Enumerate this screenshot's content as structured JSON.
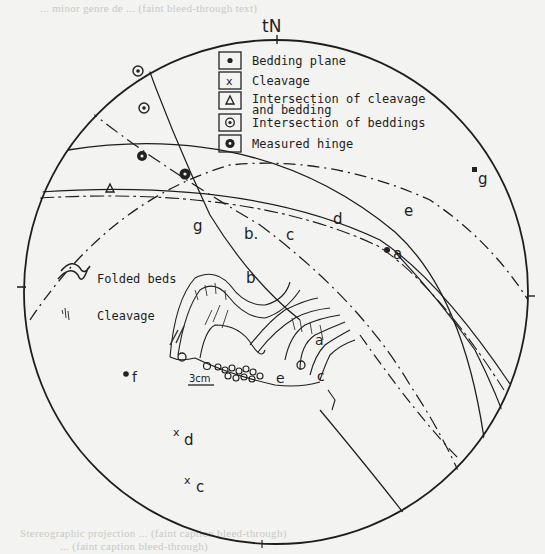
{
  "figure": {
    "north_label": "tN",
    "faint_header_text": "... minor genre de ... (faint bleed-through text)",
    "faint_caption_line1": "Stereographic projection ... (faint caption bleed-through)",
    "faint_caption_line2": "... (faint caption bleed-through)"
  },
  "legend": {
    "items": [
      {
        "symbol": "dot",
        "label": "Bedding plane"
      },
      {
        "symbol": "cross",
        "label": "Cleavage"
      },
      {
        "symbol": "triangle",
        "label": "Intersection of cleavage",
        "label2": "and bedding"
      },
      {
        "symbol": "ring-dot",
        "label": "Intersection of beddings"
      },
      {
        "symbol": "filled-ring",
        "label": "Measured hinge"
      }
    ]
  },
  "sketch_legend": {
    "folded_beds": "Folded beds",
    "cleavage": "Cleavage",
    "scale": "3cm"
  },
  "great_circle_labels": {
    "g": "g",
    "b": "b.",
    "c": "c",
    "d": "d",
    "e": "e"
  },
  "points": {
    "a": "a",
    "f": "f",
    "g_pole": "g",
    "d_cleavage": "d",
    "c_cleavage": "c"
  },
  "sketch_labels": {
    "b": "b",
    "g": "g",
    "a": "a",
    "e": "e",
    "c": "c"
  },
  "colors": {
    "ink": "#1e1e1e",
    "paper": "#f3f3f1",
    "faint": "#c9c9c6"
  }
}
